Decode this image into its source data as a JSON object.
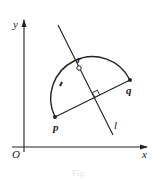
{
  "figure": {
    "axes": {
      "x_label": "x",
      "y_label": "y",
      "origin_label": "O"
    },
    "points": [
      {
        "id": "p",
        "label": "p"
      },
      {
        "id": "q",
        "label": "q"
      },
      {
        "id": "r",
        "label": "r"
      }
    ],
    "line": {
      "label": "l"
    },
    "caption": "Fig."
  }
}
